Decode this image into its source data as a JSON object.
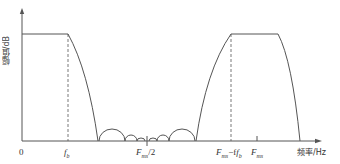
{
  "diagram": {
    "type": "frequency-response-sketch",
    "y_axis_label": "幅值/dB",
    "x_axis_label": "频率/Hz",
    "origin_label": "0",
    "x_ticks": [
      {
        "label_main": "f",
        "label_sub": "b",
        "position": "passband edge"
      },
      {
        "label_main": "F",
        "label_sub": "ms",
        "label_suffix": "/2",
        "position": "midpoint"
      },
      {
        "label_main": "F",
        "label_sub": "ms",
        "label_suffix": "−f",
        "label_sub2": "b",
        "position": "image passband edge"
      },
      {
        "label_main": "F",
        "label_sub": "ms",
        "position": "sampling frequency"
      }
    ],
    "colors": {
      "line": "#555555",
      "background": "#ffffff",
      "text": "#333333"
    }
  }
}
